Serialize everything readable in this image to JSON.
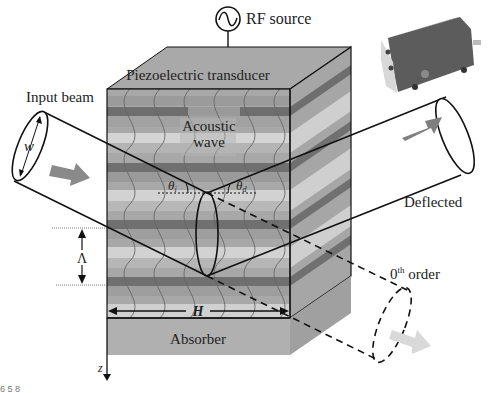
{
  "diagram": {
    "labels": {
      "rf_source": "RF source",
      "transducer": "Piezoelectric transducer",
      "input_beam": "Input beam",
      "acoustic_wave_line1": "Acoustic",
      "acoustic_wave_line2": "wave",
      "beam_width": "w",
      "theta_i": "θ",
      "theta_i_sub": "i",
      "theta_d": "θ",
      "theta_d_sub": "d",
      "deflected": "Deflected",
      "wavelength": "Λ",
      "zeroth_order_base": "0",
      "zeroth_order_sup": "th",
      "zeroth_order_text": " order",
      "height": "H",
      "absorber": "Absorber",
      "z_axis": "z",
      "corner_text": "6 5 8"
    },
    "colors": {
      "line": "#111111",
      "top_face": "#a9a9a9",
      "absorber": "#b0b0b0",
      "stripe_dark": "#6e6e6e",
      "stripe_mid": "#9a9a9a",
      "stripe_light": "#d4d4d4",
      "arrow_input": "#8a8a8a",
      "arrow_deflected": "#7f7f7f",
      "arrow_zeroth": "#d9d9d9",
      "device_body": "#5c5c5c"
    }
  }
}
